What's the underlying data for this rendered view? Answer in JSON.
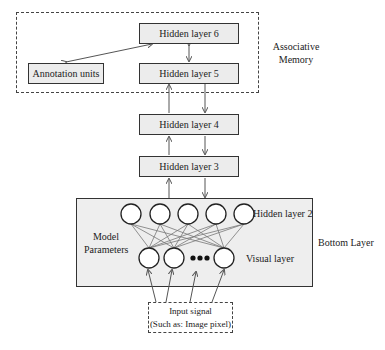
{
  "diagram": {
    "associative_memory": {
      "label_line1": "Associative",
      "label_line2": "Memory",
      "nodes": {
        "hidden6": "Hidden layer 6",
        "hidden5": "Hidden layer 5",
        "annotation": "Annotation units"
      }
    },
    "hidden4": "Hidden layer 4",
    "hidden3": "Hidden layer 3",
    "bottom_layer": {
      "label": "Bottom Layer",
      "hidden2_label": "Hidden layer 2",
      "visual_label": "Visual layer",
      "model_params_line1": "Model",
      "model_params_line2": "Parameters",
      "hidden_units": 5,
      "visual_units_shown": 3,
      "ellipsis": "•••"
    },
    "input": {
      "line1": "Input signal",
      "line2": "(Such as: Image pixel)"
    },
    "colors": {
      "box_fill": "#ececec",
      "stroke": "#333333"
    }
  }
}
